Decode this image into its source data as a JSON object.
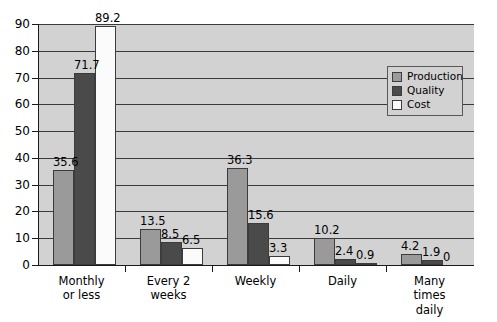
{
  "chart_data": {
    "type": "bar",
    "title": "",
    "subtitle": "",
    "xlabel": "",
    "ylabel": "",
    "ylim": [
      0,
      90
    ],
    "ytick_step": 10,
    "yticks": [
      "0",
      "10",
      "20",
      "30",
      "40",
      "50",
      "60",
      "70",
      "80",
      "90"
    ],
    "grid": true,
    "legend_position": "top-right",
    "categories": [
      "Monthly\nor less",
      "Every 2\nweeks",
      "Weekly",
      "Daily",
      "Many\ntimes\ndaily"
    ],
    "category_lines": [
      [
        "Monthly",
        "or less"
      ],
      [
        "Every 2",
        "weeks"
      ],
      [
        "Weekly"
      ],
      [
        "Daily"
      ],
      [
        "Many",
        "times",
        "daily"
      ]
    ],
    "series": [
      {
        "name": "Production",
        "color": "#9a9a9a",
        "values": [
          35.6,
          13.5,
          36.3,
          10.2,
          4.2
        ]
      },
      {
        "name": "Quality",
        "color": "#4a4a4a",
        "values": [
          71.7,
          8.5,
          15.6,
          2.4,
          1.9
        ]
      },
      {
        "name": "Cost",
        "color": "#fbfbfb",
        "values": [
          89.2,
          6.5,
          3.3,
          0.9,
          0
        ]
      }
    ],
    "value_labels": [
      [
        "35.6",
        "71.7",
        "89.2"
      ],
      [
        "13.5",
        "8.5",
        "6.5"
      ],
      [
        "36.3",
        "15.6",
        "3.3"
      ],
      [
        "10.2",
        "2.4",
        "0.9"
      ],
      [
        "4.2",
        "1.9",
        "0"
      ]
    ],
    "colors": {
      "plot_background": "#d2d2d2",
      "gridline": "#3a3a3a",
      "axis": "#1a1a1a",
      "production": "#9a9a9a",
      "quality": "#4a4a4a",
      "cost": "#fbfbfb",
      "page_background": "#ffffff"
    }
  },
  "legend": {
    "items": [
      {
        "label": "Production",
        "swatch": "production"
      },
      {
        "label": "Quality",
        "swatch": "quality"
      },
      {
        "label": "Cost",
        "swatch": "cost"
      }
    ]
  },
  "axis": {
    "y": {
      "labels": [
        "90",
        "80",
        "70",
        "60",
        "50",
        "40",
        "30",
        "20",
        "10",
        "0"
      ]
    },
    "x": {
      "group_labels": [
        [
          "Monthly",
          "or less"
        ],
        [
          "Every 2",
          "weeks"
        ],
        [
          "Weekly"
        ],
        [
          "Daily"
        ],
        [
          "Many",
          "times",
          "daily"
        ]
      ]
    }
  }
}
